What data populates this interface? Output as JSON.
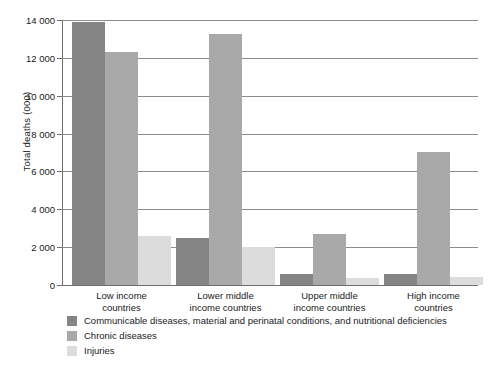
{
  "chart_data": {
    "type": "bar",
    "title": "",
    "subtitle": "",
    "xlabel": "",
    "ylabel": "Total deaths (000)",
    "ylim": [
      0,
      14000
    ],
    "ytick_step": 2000,
    "ytick_labels": [
      "0",
      "2 000",
      "4 000",
      "6 000",
      "8 000",
      "10 000",
      "12 000",
      "14 000"
    ],
    "ytick_values": [
      0,
      2000,
      4000,
      6000,
      8000,
      10000,
      12000,
      14000
    ],
    "grid": true,
    "legend_position": "below",
    "categories": [
      "Low income countries",
      "Lower middle income countries",
      "Upper middle income countries",
      "High income countries"
    ],
    "category_lines": [
      [
        "Low income",
        "countries"
      ],
      [
        "Lower middle",
        "income countries"
      ],
      [
        "Upper middle",
        "income countries"
      ],
      [
        "High income",
        "countries"
      ]
    ],
    "series": [
      {
        "name": "Communicable diseases, material and perinatal conditions, and nutritional deficiencies",
        "color": "#858585",
        "values": [
          13900,
          2500,
          600,
          600
        ]
      },
      {
        "name": "Chronic diseases",
        "color": "#a9a9a9",
        "values": [
          12300,
          13250,
          2700,
          7050
        ]
      },
      {
        "name": "Injuries",
        "color": "#dcdcdc",
        "values": [
          2600,
          2000,
          350,
          400
        ]
      }
    ]
  },
  "axis": {
    "y_title": "Total deaths (000)"
  },
  "colors": {
    "series_1": "#858585",
    "series_2": "#a9a9a9",
    "series_3": "#dcdcdc",
    "gridline": "#8c8c8c",
    "axis": "#6e6e6e",
    "text": "#1a1a1a",
    "background": "#ffffff"
  }
}
